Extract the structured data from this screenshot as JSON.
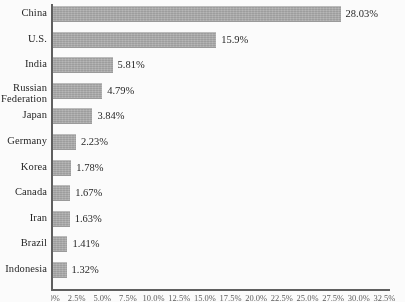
{
  "chart_data": {
    "type": "bar",
    "orientation": "horizontal",
    "title": "",
    "subtitle": "",
    "xlabel": "",
    "ylabel": "",
    "xlim": [
      0,
      32.0
    ],
    "grid": false,
    "legend": null,
    "bar_color": "#a9a9a9",
    "axis_color": "#5d5d5d",
    "categories": [
      "China",
      "U.S.",
      "India",
      "Russian\nFederation",
      "Japan",
      "Germany",
      "Korea",
      "Canada",
      "Iran",
      "Brazil",
      "Indonesia"
    ],
    "values": [
      28.03,
      15.9,
      5.81,
      4.79,
      3.84,
      2.23,
      1.78,
      1.67,
      1.63,
      1.41,
      1.32
    ],
    "value_labels": [
      "28.03%",
      "15.9%",
      "5.81%",
      "4.79%",
      "3.84%",
      "2.23%",
      "1.78%",
      "1.67%",
      "1.63%",
      "1.41%",
      "1.32%"
    ],
    "xticks": [
      0.0,
      2.5,
      5.0,
      7.5,
      10.0,
      12.5,
      15.0,
      17.5,
      20.0,
      22.5,
      25.0,
      27.5,
      30.0,
      32.5
    ],
    "xticklabels": [
      "0.0%",
      "2.5%",
      "5.0%",
      "7.5%",
      "10.0%",
      "12.5%",
      "15.0%",
      "17.5%",
      "20.0%",
      "22.5%",
      "25.0%",
      "27.5%",
      "30.0%",
      "32.5%"
    ]
  }
}
